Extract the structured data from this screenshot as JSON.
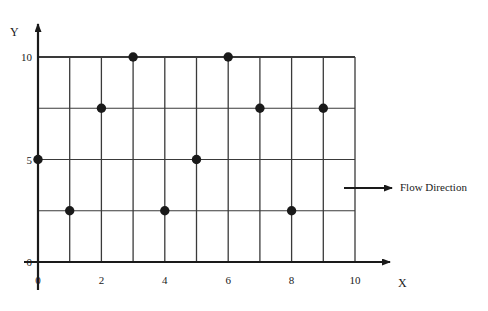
{
  "chart_data": {
    "type": "scatter",
    "title": "",
    "xlabel": "X",
    "ylabel": "Y",
    "xlim": [
      0,
      10
    ],
    "ylim": [
      0,
      10
    ],
    "grid": true,
    "x_ticks": [
      0,
      2,
      4,
      6,
      8,
      10
    ],
    "x_tick_labels": [
      "0",
      "2",
      "4",
      "6",
      "8",
      "10"
    ],
    "y_ticks": [
      0,
      5,
      10
    ],
    "y_tick_labels": [
      "0",
      "5",
      "10"
    ],
    "x_gridlines": [
      0,
      1,
      2,
      3,
      4,
      5,
      6,
      7,
      8,
      9,
      10
    ],
    "y_gridlines": [
      0,
      2.5,
      5,
      7.5,
      10
    ],
    "points": [
      {
        "x": 0,
        "y": 5
      },
      {
        "x": 1,
        "y": 2.5
      },
      {
        "x": 2,
        "y": 7.5
      },
      {
        "x": 3,
        "y": 10
      },
      {
        "x": 4,
        "y": 2.5
      },
      {
        "x": 5,
        "y": 5
      },
      {
        "x": 6,
        "y": 10
      },
      {
        "x": 7,
        "y": 7.5
      },
      {
        "x": 8,
        "y": 2.5
      },
      {
        "x": 9,
        "y": 7.5
      }
    ],
    "marker": {
      "shape": "circle",
      "color": "#1a1a1a",
      "size": 7
    },
    "colors": {
      "grid": "#3a3a3a",
      "axis": "#1a1a1a",
      "marker": "#1a1a1a",
      "text": "#1a1a1a",
      "background": "#ffffff"
    },
    "annotations": [
      {
        "name": "flow-direction",
        "label": "Flow Direction",
        "type": "arrow",
        "direction": "right"
      }
    ]
  },
  "axis": {
    "y_name": "Y",
    "x_name": "X"
  }
}
